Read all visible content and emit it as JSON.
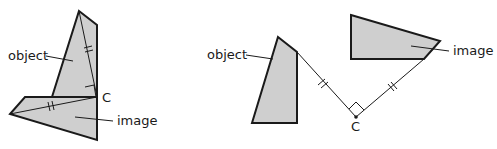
{
  "diagrams": [
    {
      "id": "rotation-example-1",
      "labels": {
        "object": "object",
        "image": "image",
        "center": "C"
      }
    },
    {
      "id": "rotation-example-2",
      "labels": {
        "object": "object",
        "image": "image",
        "center": "C"
      }
    }
  ],
  "colors": {
    "fill": "#cfcfcf",
    "stroke": "#1a1a1a",
    "background": "#ffffff"
  }
}
